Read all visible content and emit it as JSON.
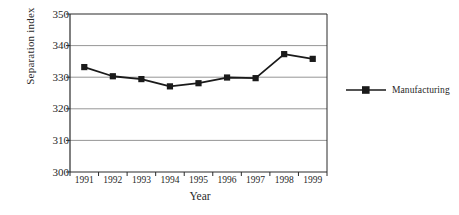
{
  "chart_data": {
    "type": "line",
    "title": "",
    "xlabel": "Year",
    "ylabel": "Separation index",
    "categories": [
      "1991",
      "1992",
      "1993",
      "1994",
      "1995",
      "1996",
      "1997",
      "1998",
      "1999"
    ],
    "series": [
      {
        "name": "Manufacturing",
        "values": [
          333.2,
          330.3,
          329.4,
          327.1,
          328.1,
          329.9,
          329.7,
          337.3,
          335.8
        ],
        "color": "#1a1a1a",
        "marker": "square"
      }
    ],
    "ylim": [
      300,
      350
    ],
    "yticks": [
      300,
      310,
      320,
      330,
      340,
      350
    ],
    "ytick_labels": [
      "300",
      "310",
      "320",
      "330",
      "340",
      "350"
    ],
    "grid": true,
    "grid_axis": "y",
    "grid_color": "#8a8a8a",
    "legend_position": "right",
    "axis_color": "#2b2b2b",
    "background": "#ffffff"
  },
  "legend": {
    "entries": [
      {
        "label": "Manufacturing"
      }
    ]
  }
}
